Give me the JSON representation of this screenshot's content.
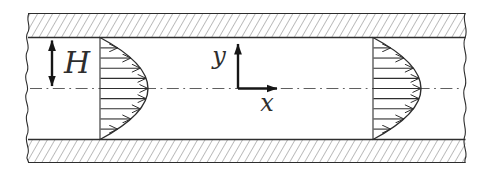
{
  "diagram": {
    "labels": {
      "channel_half_height": "H",
      "axis_vertical": "y",
      "axis_horizontal": "x"
    },
    "colors": {
      "background": "#ffffff",
      "line": "#2e2e2e",
      "hatch": "#6e6e6e",
      "centerline": "#5f5f5f",
      "arrow_fill": "#161616"
    }
  }
}
